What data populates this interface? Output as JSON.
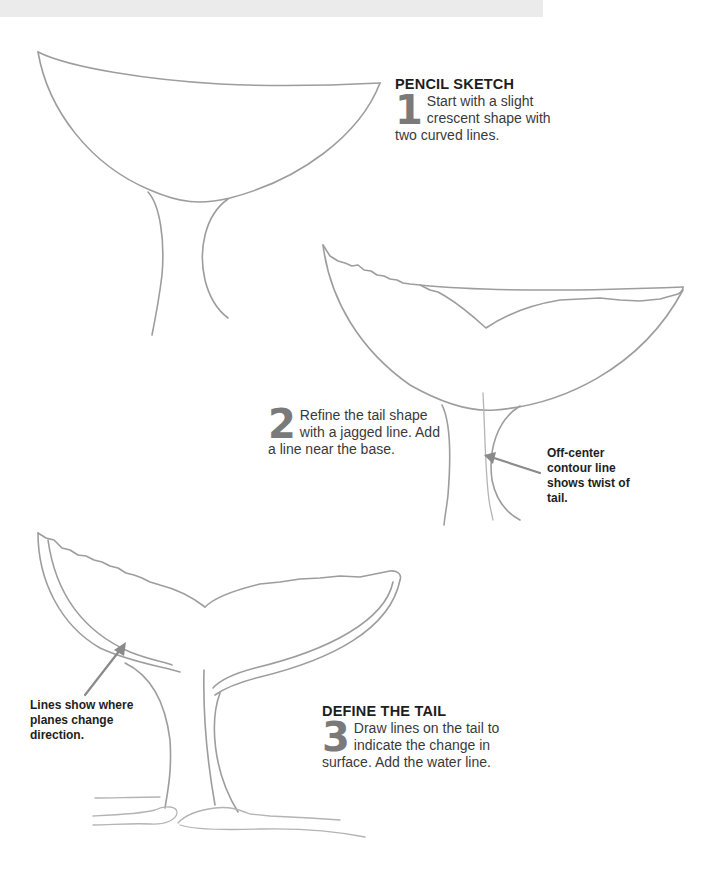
{
  "header_band": {
    "color": "#ebebeb"
  },
  "steps": [
    {
      "heading": "PENCIL SKETCH",
      "number": "1",
      "text": "Start with a slight crescent shape with two curved lines."
    },
    {
      "heading": "",
      "number": "2",
      "text": "Refine the tail shape with a jagged line. Add a line near the base."
    },
    {
      "heading": "DEFINE THE TAIL",
      "number": "3",
      "text": "Draw lines on the tail to indicate the change in surface. Add the water line."
    }
  ],
  "annotations": [
    {
      "text": "Off-center contour line shows twist of tail.",
      "points_to": "stem contour line"
    },
    {
      "text": "Lines show where planes change direction.",
      "points_to": "fluke underside plane line"
    }
  ],
  "illustrations": [
    {
      "label": "whale-tail-sketch-stage-1"
    },
    {
      "label": "whale-tail-sketch-stage-2"
    },
    {
      "label": "whale-tail-sketch-stage-3"
    }
  ],
  "colors": {
    "pencil_stroke": "#9d9d9d",
    "step_number": "#7a7a7a",
    "text": "#2a2a2a",
    "arrow": "#8a8a8a"
  }
}
